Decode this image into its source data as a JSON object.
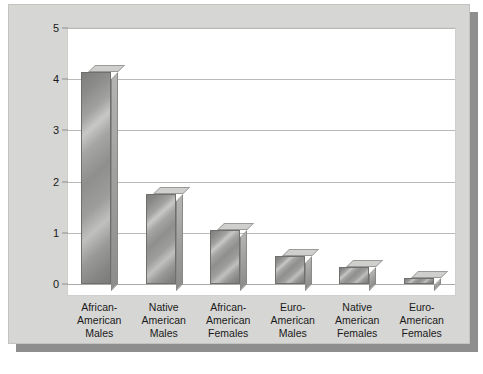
{
  "chart_data": {
    "type": "bar",
    "title": "",
    "subtitle": "",
    "xlabel": "",
    "ylabel": "Number of Homicides Per 100 Persons",
    "ylim": [
      0,
      5
    ],
    "yticks": [
      0,
      1,
      2,
      3,
      4,
      5
    ],
    "ytick_labels": [
      "0",
      "1",
      "2",
      "3",
      "4",
      "5"
    ],
    "grid": true,
    "legend": null,
    "style": "3d-bars-grayscale",
    "categories": [
      "African-American Males",
      "Native American Males",
      "African-American Females",
      "Euro-American Males",
      "Native American Females",
      "Euro-American Females"
    ],
    "category_lines": [
      [
        "African-",
        "American",
        "Males"
      ],
      [
        "Native",
        "American",
        "Males"
      ],
      [
        "African-",
        "American",
        "Females"
      ],
      [
        "Euro-",
        "American",
        "Males"
      ],
      [
        "Native",
        "American",
        "Females"
      ],
      [
        "Euro-",
        "American",
        "Females"
      ]
    ],
    "values": [
      4.15,
      1.75,
      1.05,
      0.55,
      0.33,
      0.12
    ]
  },
  "colors": {
    "panel_background": "#d6d6d4",
    "panel_shadow": "#8e8e8e",
    "plot_background": "#ffffff",
    "gridline": "#b9b9b7",
    "bar_front": "#9a9a98",
    "bar_top": "#cfcfcd",
    "bar_side": "#8d8d8b",
    "text": "#1a1a1a"
  }
}
